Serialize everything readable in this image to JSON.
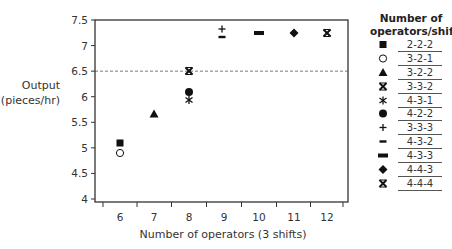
{
  "chart_data": {
    "type": "scatter",
    "title": "",
    "xlabel": "Number of operators (3 shifts)",
    "ylabel": "Output (pieces/hr)",
    "ylabel_lines": [
      "Output",
      "(pieces/hr)"
    ],
    "x_ticks": [
      6,
      7,
      8,
      9,
      10,
      11,
      12
    ],
    "y_ticks": [
      4,
      4.5,
      5,
      5.5,
      6,
      6.5,
      7,
      7.5
    ],
    "xlim": [
      5.3,
      12.6
    ],
    "ylim": [
      3.9,
      7.5
    ],
    "grid": false,
    "reference_line": {
      "y": 6.5,
      "style": "dashed"
    },
    "legend_title": [
      "Number of",
      "operators/shift"
    ],
    "legend_position": "right",
    "series": [
      {
        "name": "2-2-2",
        "marker": "square-filled",
        "points": [
          [
            6,
            5.1
          ]
        ]
      },
      {
        "name": "3-2-1",
        "marker": "circle-open",
        "points": [
          [
            6,
            4.9
          ]
        ]
      },
      {
        "name": "3-2-2",
        "marker": "triangle-filled",
        "points": [
          [
            7,
            5.65
          ]
        ]
      },
      {
        "name": "3-3-2",
        "marker": "x-bold",
        "points": [
          [
            8,
            6.5
          ]
        ]
      },
      {
        "name": "4-3-1",
        "marker": "asterisk",
        "points": [
          [
            8,
            5.9
          ]
        ]
      },
      {
        "name": "4-2-2",
        "marker": "circle-filled",
        "points": [
          [
            8,
            6.1
          ]
        ]
      },
      {
        "name": "3-3-3",
        "marker": "plus",
        "points": [
          [
            9,
            7.27
          ]
        ]
      },
      {
        "name": "4-3-2",
        "marker": "minus",
        "points": [
          [
            9,
            7.2
          ]
        ]
      },
      {
        "name": "4-3-3",
        "marker": "bar-thick",
        "points": [
          [
            10,
            7.25
          ]
        ]
      },
      {
        "name": "4-4-3",
        "marker": "diamond-filled",
        "points": [
          [
            11,
            7.25
          ]
        ]
      },
      {
        "name": "4-4-4",
        "marker": "x-bold",
        "points": [
          [
            12,
            7.25
          ]
        ]
      }
    ]
  }
}
